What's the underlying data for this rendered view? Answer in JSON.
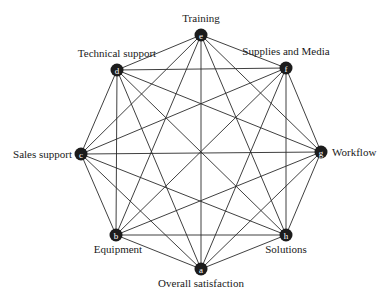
{
  "diagram": {
    "type": "complete-graph",
    "nodes": [
      {
        "id": "a",
        "label": "Overall satisfaction",
        "x": 201,
        "y": 269,
        "lx": 201,
        "ly": 287,
        "anchor": "middle"
      },
      {
        "id": "b",
        "label": "Equipment",
        "x": 116,
        "y": 235,
        "lx": 118,
        "ly": 253,
        "anchor": "middle"
      },
      {
        "id": "c",
        "label": "Sales support",
        "x": 81,
        "y": 154,
        "lx": 72,
        "ly": 158,
        "anchor": "end"
      },
      {
        "id": "d",
        "label": "Technical support",
        "x": 117,
        "y": 70,
        "lx": 117,
        "ly": 57,
        "anchor": "middle"
      },
      {
        "id": "e",
        "label": "Training",
        "x": 201,
        "y": 35,
        "lx": 201,
        "ly": 22,
        "anchor": "middle"
      },
      {
        "id": "f",
        "label": "Supplies and Media",
        "x": 286,
        "y": 68,
        "lx": 286,
        "ly": 55,
        "anchor": "middle"
      },
      {
        "id": "g",
        "label": "Workflow",
        "x": 321,
        "y": 152,
        "lx": 332,
        "ly": 156,
        "anchor": "start"
      },
      {
        "id": "h",
        "label": "Solutions",
        "x": 286,
        "y": 235,
        "lx": 286,
        "ly": 253,
        "anchor": "middle"
      }
    ],
    "edges": "all-pairs"
  }
}
